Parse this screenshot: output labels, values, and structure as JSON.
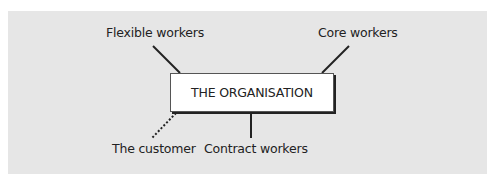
{
  "diagram": {
    "center": "THE ORGANISATION",
    "nodes": {
      "flexible": "Flexible workers",
      "core": "Core workers",
      "customer": "The customer",
      "contract": "Contract workers"
    },
    "connectors": [
      {
        "from": "Flexible workers",
        "to": "THE ORGANISATION",
        "style": "solid"
      },
      {
        "from": "Core workers",
        "to": "THE ORGANISATION",
        "style": "solid"
      },
      {
        "from": "Contract workers",
        "to": "THE ORGANISATION",
        "style": "solid"
      },
      {
        "from": "The customer",
        "to": "THE ORGANISATION",
        "style": "dotted"
      }
    ],
    "colors": {
      "background": "#e6e6e6",
      "box": "#ffffff",
      "line": "#222222"
    }
  }
}
